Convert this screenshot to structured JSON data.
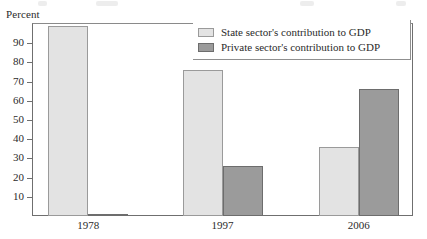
{
  "chart_data": {
    "type": "bar",
    "title": "",
    "xlabel": "",
    "ylabel": "Percent",
    "ylim": [
      0,
      100
    ],
    "ytick_labels": [
      "90",
      "80",
      "70",
      "60",
      "50",
      "40",
      "30",
      "20",
      "10"
    ],
    "ytick_values": [
      90,
      80,
      70,
      60,
      50,
      40,
      30,
      20,
      10
    ],
    "categories": [
      "1978",
      "1997",
      "2006"
    ],
    "grid": false,
    "legend_position": "top-right",
    "series": [
      {
        "name": "State sector's contribution to GDP",
        "color": "#e3e3e3",
        "values": [
          99,
          76,
          36
        ]
      },
      {
        "name": "Private sector's contribution to GDP",
        "color": "#9b9b9b",
        "values": [
          1,
          26,
          66
        ]
      }
    ]
  },
  "axis": {
    "y_title": "Percent"
  },
  "legend": {
    "items": [
      {
        "label": "State sector's contribution to GDP",
        "swatch": "state"
      },
      {
        "label": "Private sector's contribution to GDP",
        "swatch": "private"
      }
    ]
  }
}
